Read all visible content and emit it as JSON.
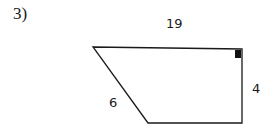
{
  "problem": {
    "number": "3)"
  },
  "diagram": {
    "shape": "right trapezoid",
    "vertices": [
      [
        93,
        47
      ],
      [
        242,
        49
      ],
      [
        242,
        123
      ],
      [
        148,
        123
      ]
    ],
    "right_angle_marker": {
      "x": 235,
      "y": 50,
      "size": 7
    },
    "stroke_color": "#1a1a1a",
    "labels": {
      "top": "19",
      "right": "4",
      "slant": "6"
    }
  }
}
